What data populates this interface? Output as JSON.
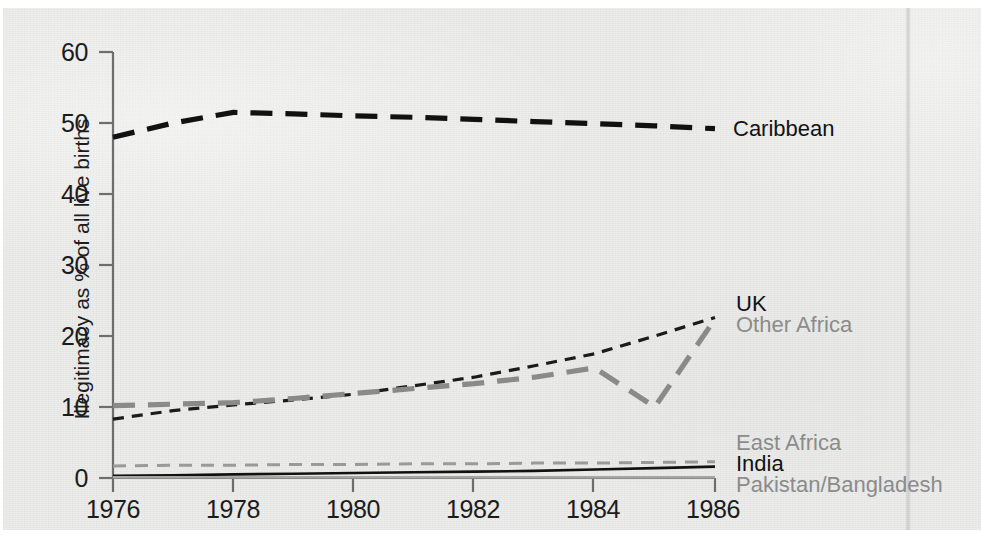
{
  "chart_data": {
    "type": "line",
    "title": "",
    "subtitle": "",
    "xlabel": "",
    "ylabel": "Illegitimacy as % of all live births",
    "xlim": [
      1976,
      1986
    ],
    "ylim": [
      0,
      60
    ],
    "grid": false,
    "legend_position": "right-inline",
    "x": [
      1976,
      1977,
      1978,
      1979,
      1980,
      1981,
      1982,
      1983,
      1984,
      1985,
      1986
    ],
    "xticks": [
      "1976",
      "1978",
      "1980",
      "1982",
      "1984",
      "1986"
    ],
    "xtick_values": [
      1976,
      1978,
      1980,
      1982,
      1984,
      1986
    ],
    "yticks": [
      "0",
      "10",
      "20",
      "30",
      "40",
      "50",
      "60"
    ],
    "ytick_values": [
      0,
      10,
      20,
      30,
      40,
      50,
      60
    ],
    "series": [
      {
        "name": "Caribbean",
        "color": "#111111",
        "style": "long-dash",
        "label_color": "#121212",
        "values": [
          48.0,
          50.0,
          51.5,
          51.3,
          51.0,
          50.8,
          50.5,
          50.2,
          49.9,
          49.6,
          49.2
        ]
      },
      {
        "name": "UK",
        "color": "#1b1b1b",
        "style": "short-dash",
        "label_color": "#121212",
        "values": [
          8.3,
          9.5,
          10.3,
          11.0,
          11.8,
          13.0,
          14.2,
          15.8,
          17.5,
          20.0,
          22.6
        ]
      },
      {
        "name": "Other Africa",
        "color": "#8a8a8a",
        "style": "long-dash",
        "label_color": "#8b8b8b",
        "values": [
          10.2,
          10.4,
          10.6,
          11.2,
          11.9,
          12.6,
          13.3,
          14.2,
          15.5,
          10.0,
          22.4
        ]
      },
      {
        "name": "East Africa",
        "color": "#9a9a9a",
        "style": "dash",
        "label_color": "#8b8b8b",
        "values": [
          1.7,
          1.8,
          1.8,
          1.9,
          1.9,
          2.0,
          2.0,
          2.1,
          2.1,
          2.2,
          2.3
        ]
      },
      {
        "name": "India",
        "color": "#111111",
        "style": "solid",
        "label_color": "#121212",
        "values": [
          0.3,
          0.4,
          0.5,
          0.6,
          0.7,
          0.8,
          0.9,
          1.0,
          1.2,
          1.4,
          1.6
        ]
      },
      {
        "name": "Pakistan/Bangladesh",
        "color": "#a6a6a6",
        "style": "solid",
        "label_color": "#8b8b8b",
        "values": [
          0.1,
          0.1,
          0.1,
          0.1,
          0.1,
          0.1,
          0.1,
          0.1,
          0.1,
          0.1,
          0.1
        ]
      }
    ]
  },
  "axes": {
    "y_axis_title": "Illegitimacy as % of all live births",
    "y_ticks": [
      "60",
      "50",
      "40",
      "30",
      "20",
      "10",
      "0"
    ],
    "x_ticks": [
      "1976",
      "1978",
      "1980",
      "1982",
      "1984",
      "1986"
    ]
  },
  "labels": {
    "caribbean": "Caribbean",
    "uk": "UK",
    "other_africa": "Other Africa",
    "east_africa": "East Africa",
    "india": "India",
    "pakistan_bangladesh": "Pakistan/Bangladesh"
  },
  "colors": {
    "ink_dark": "#111111",
    "ink_gray": "#8b8b8b",
    "paper": "#ececeb",
    "axis": "#6e6e6e"
  }
}
